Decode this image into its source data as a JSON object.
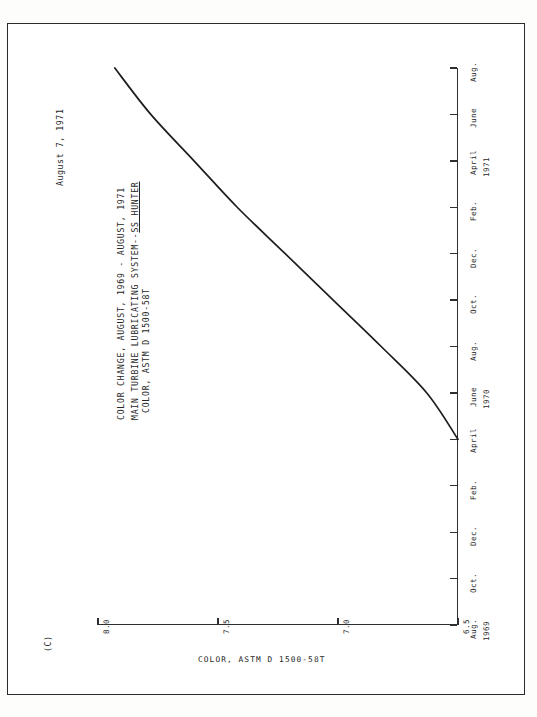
{
  "document": {
    "date_stamp": "August 7, 1971",
    "copy_mark": "(C)"
  },
  "title": {
    "line1": "COLOR CHANGE, AUGUST, 1969 - AUGUST, 1971",
    "line2_prefix": "MAIN TURBINE LUBRICATING SYSTEM--",
    "line2_underlined": "SS HUNTER",
    "line3": "COLOR, ASTM D 1500-58T"
  },
  "chart_data": {
    "type": "line",
    "subtitle": "COLOR, ASTM D 1500-58T",
    "orientation": "rotated-90",
    "xlabel": "COLOR, ASTM D 1500-58T",
    "ylabel": "",
    "grid": false,
    "legend": false,
    "value_axis": {
      "name": "COLOR, ASTM D 1500-58T",
      "ticks": [
        "8.0",
        "7.5",
        "7.0",
        "6.5"
      ],
      "values": [
        8.0,
        7.5,
        7.0,
        6.5
      ],
      "range": [
        8.0,
        6.5
      ],
      "direction": "decreasing-left-to-right"
    },
    "time_axis": {
      "name": "Date",
      "ticks": [
        {
          "label": "Aug.",
          "year": "1969"
        },
        {
          "label": "Oct.",
          "year": ""
        },
        {
          "label": "Dec.",
          "year": ""
        },
        {
          "label": "Feb.",
          "year": ""
        },
        {
          "label": "April",
          "year": ""
        },
        {
          "label": "June",
          "year": "1970"
        },
        {
          "label": "Aug.",
          "year": ""
        },
        {
          "label": "Oct.",
          "year": ""
        },
        {
          "label": "Dec.",
          "year": ""
        },
        {
          "label": "Feb.",
          "year": ""
        },
        {
          "label": "April",
          "year": "1971"
        },
        {
          "label": "June",
          "year": ""
        },
        {
          "label": "Aug.",
          "year": ""
        }
      ],
      "range": [
        "Aug. 1969",
        "Aug. 1971"
      ]
    },
    "series": [
      {
        "name": "Color, ASTM D 1500-58T",
        "points": [
          {
            "date": "April 1970",
            "color": 6.5
          },
          {
            "date": "June 1970",
            "color": 6.63
          },
          {
            "date": "Aug. 1970",
            "color": 6.82
          },
          {
            "date": "Oct. 1970",
            "color": 7.02
          },
          {
            "date": "Dec. 1970",
            "color": 7.22
          },
          {
            "date": "Feb. 1971",
            "color": 7.42
          },
          {
            "date": "April 1971",
            "color": 7.6
          },
          {
            "date": "June 1971",
            "color": 7.78
          },
          {
            "date": "Aug. 1971",
            "color": 7.93
          }
        ]
      }
    ]
  }
}
